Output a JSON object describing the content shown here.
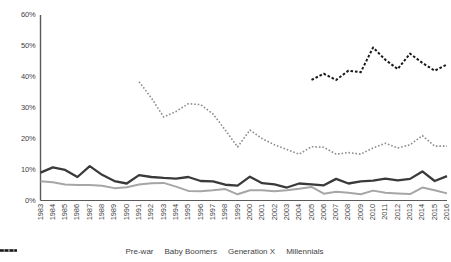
{
  "chart_data": {
    "type": "line",
    "title": "",
    "xlabel": "",
    "ylabel": "",
    "ylim": [
      0,
      60
    ],
    "ytick_labels": [
      "0%",
      "10%",
      "20%",
      "30%",
      "40%",
      "50%",
      "60%"
    ],
    "ytick_values": [
      0,
      10,
      20,
      30,
      40,
      50,
      60
    ],
    "grid": false,
    "legend_position": "bottom",
    "categories": [
      "1983",
      "1984",
      "1985",
      "1986",
      "1987",
      "1988",
      "1989",
      "1990",
      "1991",
      "1992",
      "1993",
      "1994",
      "1995",
      "1996",
      "1997",
      "1998",
      "1999",
      "2000",
      "2001",
      "2002",
      "2003",
      "2004",
      "2005",
      "2006",
      "2007",
      "2008",
      "2009",
      "2010",
      "2011",
      "2012",
      "2013",
      "2014",
      "2015",
      "2016"
    ],
    "series": [
      {
        "name": "Pre-war",
        "color": "#a6a6a6",
        "style": "solid",
        "width": 2.0,
        "values": [
          6.2,
          5.9,
          5.2,
          5.0,
          5.0,
          4.8,
          4.0,
          4.3,
          5.2,
          5.6,
          5.7,
          4.5,
          3.1,
          3.0,
          3.3,
          3.7,
          2.0,
          3.3,
          3.3,
          3.0,
          3.3,
          3.8,
          4.4,
          2.2,
          2.8,
          2.5,
          2.0,
          3.2,
          2.5,
          2.3,
          2.1,
          4.2,
          3.3,
          2.3
        ]
      },
      {
        "name": "Baby Boomers",
        "color": "#3a3a3a",
        "style": "solid",
        "width": 2.3,
        "values": [
          9.0,
          10.7,
          9.9,
          7.6,
          11.1,
          8.3,
          6.3,
          5.5,
          8.2,
          7.6,
          7.3,
          7.1,
          7.6,
          6.3,
          6.2,
          5.1,
          4.8,
          7.7,
          5.6,
          5.2,
          4.2,
          5.5,
          5.2,
          4.9,
          7.0,
          5.5,
          6.2,
          6.4,
          7.1,
          6.5,
          7.0,
          9.4,
          6.3,
          7.9
        ]
      },
      {
        "name": "Generation X",
        "color": "#8c8c8c",
        "style": "dashed-fine",
        "width": 1.6,
        "values": [
          null,
          null,
          null,
          null,
          null,
          null,
          null,
          null,
          38.4,
          33.2,
          27.0,
          28.8,
          31.3,
          31.0,
          28.0,
          22.8,
          17.3,
          22.8,
          20.0,
          18.0,
          16.5,
          15.0,
          17.4,
          17.2,
          15.0,
          15.5,
          15.0,
          17.0,
          18.5,
          17.0,
          18.0,
          21.0,
          17.6,
          17.6
        ]
      },
      {
        "name": "Millennials",
        "color": "#1a1a1a",
        "style": "dashed-bold",
        "width": 2.0,
        "values": [
          null,
          null,
          null,
          null,
          null,
          null,
          null,
          null,
          null,
          null,
          null,
          null,
          null,
          null,
          null,
          null,
          null,
          null,
          null,
          null,
          null,
          null,
          39.0,
          41.0,
          39.0,
          42.0,
          41.5,
          49.5,
          45.5,
          42.5,
          47.5,
          44.5,
          42.0,
          44.0
        ]
      }
    ]
  },
  "legend": {
    "items": [
      {
        "label": "Pre-war"
      },
      {
        "label": "Baby Boomers"
      },
      {
        "label": "Generation X"
      },
      {
        "label": "Millennials"
      }
    ]
  }
}
